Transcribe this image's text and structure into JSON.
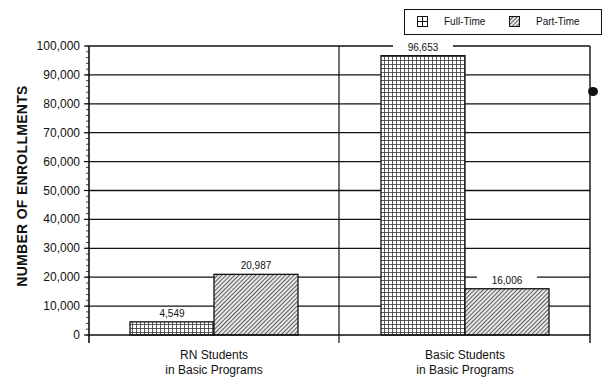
{
  "chart_data": {
    "type": "bar",
    "title": "",
    "xlabel": "",
    "ylabel": "NUMBER OF ENROLLMENTS",
    "ylim": [
      0,
      100000
    ],
    "yticks": [
      "0",
      "10,000",
      "20,000",
      "30,000",
      "40,000",
      "50,000",
      "60,000",
      "70,000",
      "80,000",
      "90,000",
      "100,000"
    ],
    "grid": true,
    "legend_position": "top-right",
    "categories": [
      "RN Students in Basic Programs",
      "Basic Students in Basic Programs"
    ],
    "category_lines": [
      [
        "RN Students",
        "in Basic Programs"
      ],
      [
        "Basic Students",
        "in Basic Programs"
      ]
    ],
    "series": [
      {
        "name": "Full-Time",
        "pattern": "grid",
        "values": [
          4549,
          96653
        ],
        "labels": [
          "4,549",
          "96,653"
        ]
      },
      {
        "name": "Part-Time",
        "pattern": "diagonal-hatch",
        "values": [
          20987,
          16006
        ],
        "labels": [
          "20,987",
          "16,006"
        ]
      }
    ]
  },
  "legend": {
    "full_time": "Full-Time",
    "part_time": "Part-Time"
  },
  "axis": {
    "ylabel": "NUMBER OF ENROLLMENTS"
  },
  "colors": {
    "ink": "#111111",
    "background": "#ffffff"
  }
}
